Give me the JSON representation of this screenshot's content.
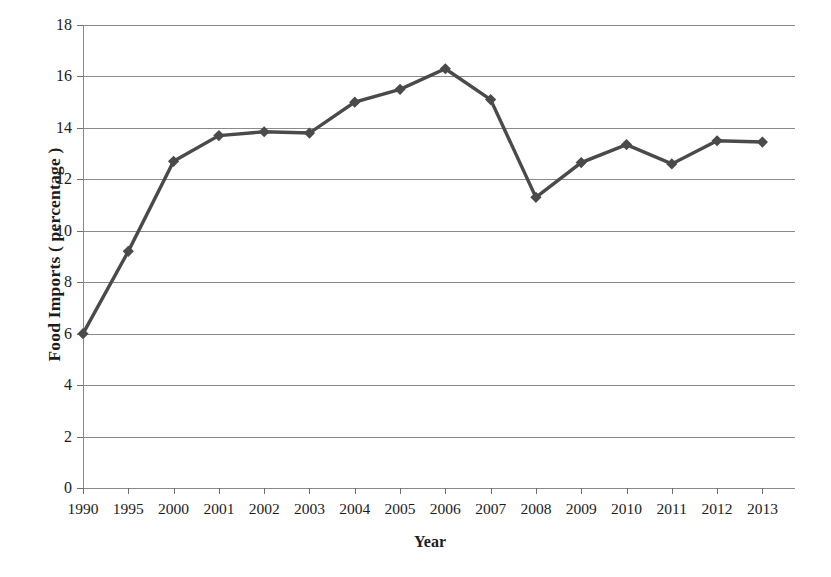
{
  "chart_data": {
    "type": "line",
    "title": "",
    "xlabel": "Year",
    "ylabel": "Food Imports ( percentage )",
    "categories": [
      "1990",
      "1995",
      "2000",
      "2001",
      "2002",
      "2003",
      "2004",
      "2005",
      "2006",
      "2007",
      "2008",
      "2009",
      "2010",
      "2011",
      "2012",
      "2013"
    ],
    "values": [
      6.0,
      9.2,
      12.7,
      13.7,
      13.85,
      13.8,
      15.0,
      15.5,
      16.3,
      15.1,
      11.3,
      12.65,
      13.35,
      12.6,
      13.5,
      13.45
    ],
    "ylim": [
      0,
      18
    ],
    "ytick_labels": [
      "0",
      "2",
      "4",
      "6",
      "8",
      "10",
      "12",
      "14",
      "16",
      "18"
    ],
    "ytick_values": [
      0,
      2,
      4,
      6,
      8,
      10,
      12,
      14,
      16,
      18
    ],
    "grid": "horizontal",
    "legend": "none",
    "series_color": "#4a4a4a",
    "gridline_color": "#8a8a8a",
    "marker": "diamond",
    "background_color": "#ffffff"
  }
}
